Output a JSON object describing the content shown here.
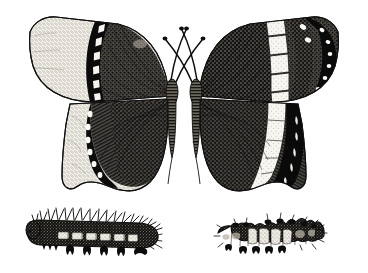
{
  "illustration": {
    "title": "Butterflies and their caterpillars",
    "style": "black-and-white scientific engraving / line illustration",
    "background_color": "#ffffff",
    "ink_color": "#0d0d0d",
    "caption": "",
    "figure_count": 4,
    "layout": "two butterflies with spread wings on the upper row, two caterpillars in side view on the lower row"
  },
  "figures": [
    {
      "id": "butterfly-left",
      "name": "mourning-cloak-butterfly",
      "position": "upper left",
      "view": "dorsal, wings spread",
      "body": {
        "thorax": "stout and furry, shaggy pale hairs",
        "abdomen": "tapering, banded with fine hatching",
        "antennae_count": 2,
        "antennae_shape": "long, slender, curving outward with clubbed tips"
      },
      "forewing": {
        "ground_color": "dark, densely stippled brown-black",
        "margin_band": "broad pale cream stippled border",
        "submarginal_band": "solid black band",
        "spot_row": "row of pale chevron spots inside the black band",
        "outer_edge": "slightly ragged and irregular"
      },
      "hindwing": {
        "ground_color": "dark, radiating hatch lines from the base",
        "margin_band": "pale cream scalloped border",
        "spot_row": "row of white oval spots along the dark inner edge of the border",
        "outer_edge": "deeply scalloped / wavy"
      }
    },
    {
      "id": "butterfly-right",
      "name": "white-admiral-butterfly",
      "position": "upper right",
      "view": "dorsal, wings spread",
      "body": {
        "thorax": "stout and furry",
        "abdomen": "slender, tapering, finely hatched",
        "antennae_count": 2,
        "antennae_shape": "long, slender, curving outward with clubbed tips"
      },
      "forewing": {
        "ground_color": "dark, densely stippled",
        "median_band": "bold white band of about five rectangular blocks divided by vein lines",
        "apex": "solid black wing tip",
        "spot_row": "series of small white spots along the dark apex and outer margin"
      },
      "hindwing": {
        "ground_color": "dark, radiating hatch lines from the base",
        "median_band": "white band continuing from the forewing, curving to the inner edge",
        "margin": "black outer border with a row of pale crescent spots"
      }
    },
    {
      "id": "caterpillar-left",
      "name": "spiny-caterpillar",
      "position": "lower left",
      "view": "side view, head to the left",
      "body": "elongate, dark and mottled with a row of paler saddle patches along the back",
      "armature": "dense rows of long branched spines along the back and sides",
      "legs": "three pairs of true legs in front and four pairs of stout prolegs below",
      "segments_visible": 12
    },
    {
      "id": "caterpillar-right",
      "name": "humped-caterpillar",
      "position": "lower right",
      "view": "side view, head to the right",
      "body": "stout and humped, dark mottled ground with three to four pale cream saddle patches across the middle segments",
      "armature": "short knobby tubercles and bristled projections along the back",
      "legs": "short prolegs beneath the middle segments",
      "segments_visible": 11
    }
  ]
}
